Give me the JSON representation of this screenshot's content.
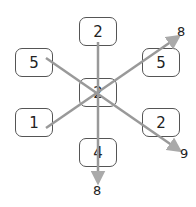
{
  "diagram": {
    "center": "2",
    "boxes": {
      "top": "2",
      "upper_left": "5",
      "upper_right": "5",
      "lower_left": "1",
      "lower_right": "2",
      "bottom": "4"
    },
    "results": {
      "vertical": "8",
      "diagonal_up": "8",
      "diagonal_down": "9"
    },
    "colors": {
      "arrow": "#aaaaaa",
      "box_border": "#555555"
    }
  }
}
